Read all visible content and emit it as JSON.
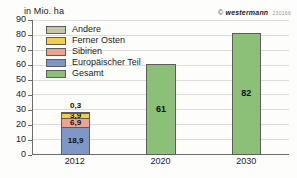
{
  "unit_caption": "in Mio. ha",
  "watermark": {
    "symbol": "©",
    "brand": "westermann",
    "code": "230166"
  },
  "legend": {
    "items": [
      {
        "label": "Andere",
        "color": "#c8c5a8"
      },
      {
        "label": "Ferner Osten",
        "color": "#f2cf4a"
      },
      {
        "label": "Sibirien",
        "color": "#eda392"
      },
      {
        "label": "Europäischer Teil",
        "color": "#7f97c4"
      },
      {
        "label": "Gesamt",
        "color": "#8cbf77"
      }
    ]
  },
  "chart_data": {
    "type": "bar",
    "title": "",
    "subtitle": "",
    "xlabel": "",
    "ylabel": "in Mio. ha",
    "ylim": [
      0,
      90
    ],
    "yticks": [
      0,
      10,
      20,
      30,
      40,
      50,
      60,
      70,
      80,
      90
    ],
    "ytick_labels": [
      "0",
      "10",
      "20",
      "30",
      "40",
      "50",
      "60",
      "70",
      "80",
      "90"
    ],
    "grid": true,
    "legend_position": "upper-left-inside",
    "categories": [
      "2012",
      "2020",
      "2030"
    ],
    "series": [
      {
        "name": "Europäischer Teil",
        "color": "#7f97c4",
        "values": [
          18.9,
          null,
          null
        ],
        "labels": [
          "18,9",
          "",
          ""
        ]
      },
      {
        "name": "Sibirien",
        "color": "#eda392",
        "values": [
          6.9,
          null,
          null
        ],
        "labels": [
          "6,9",
          "",
          ""
        ]
      },
      {
        "name": "Ferner Osten",
        "color": "#f2cf4a",
        "values": [
          3.9,
          null,
          null
        ],
        "labels": [
          "3,9",
          "",
          ""
        ]
      },
      {
        "name": "Andere",
        "color": "#c8c5a8",
        "values": [
          0.3,
          null,
          null
        ],
        "labels": [
          "0,3",
          "",
          ""
        ]
      },
      {
        "name": "Gesamt",
        "color": "#8cbf77",
        "values": [
          null,
          61,
          82
        ],
        "labels": [
          "",
          "61",
          "82"
        ]
      }
    ],
    "bars": [
      {
        "category": "2012",
        "stacked": true,
        "total": 30.0,
        "segments": [
          {
            "name": "Europäischer Teil",
            "value": 18.9,
            "label": "18,9",
            "color": "#7f97c4",
            "label_position": "inside"
          },
          {
            "name": "Sibirien",
            "value": 6.9,
            "label": "6,9",
            "color": "#eda392",
            "label_position": "inside"
          },
          {
            "name": "Ferner Osten",
            "value": 3.9,
            "label": "3,9",
            "color": "#f2cf4a",
            "label_position": "inside"
          },
          {
            "name": "Andere",
            "value": 0.3,
            "label": "0,3",
            "color": "#c8c5a8",
            "label_position": "outside"
          }
        ]
      },
      {
        "category": "2020",
        "stacked": false,
        "total": 61,
        "segments": [
          {
            "name": "Gesamt",
            "value": 61,
            "label": "61",
            "color": "#8cbf77",
            "label_position": "inside"
          }
        ]
      },
      {
        "category": "2030",
        "stacked": false,
        "total": 82,
        "segments": [
          {
            "name": "Gesamt",
            "value": 82,
            "label": "82",
            "color": "#8cbf77",
            "label_position": "inside"
          }
        ]
      }
    ]
  }
}
